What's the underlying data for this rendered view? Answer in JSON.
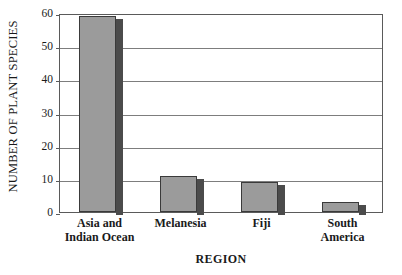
{
  "chart_data": {
    "type": "bar",
    "title": "",
    "xlabel": "REGION",
    "ylabel": "NUMBER OF PLANT SPECIES",
    "categories": [
      "Asia and Indian Ocean",
      "Melanesia",
      "Fiji",
      "South America"
    ],
    "category_lines": [
      [
        "Asia and",
        "Indian Ocean"
      ],
      [
        "Melanesia"
      ],
      [
        "Fiji"
      ],
      [
        "South",
        "America"
      ]
    ],
    "values": [
      59,
      11,
      9,
      3
    ],
    "ylim": [
      0,
      60
    ],
    "yticks": [
      0,
      10,
      20,
      30,
      40,
      50,
      60
    ],
    "ytick_labels": [
      "0",
      "10",
      "20",
      "30",
      "40",
      "50",
      "60"
    ],
    "grid": "horizontal",
    "legend": "none",
    "series": [
      {
        "name": "Number of plant species",
        "values": [
          59,
          11,
          9,
          3
        ]
      }
    ],
    "colors": {
      "bar_face": "#9b9b9b",
      "bar_outline": "#3a3a3a",
      "bar_shadow": "#4b4b4b",
      "gridline": "#7d7d7d",
      "frame": "#5a5a5a",
      "background": "#ffffff",
      "text": "#1a1a1a"
    }
  }
}
